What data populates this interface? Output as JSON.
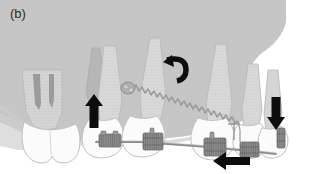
{
  "figure": {
    "panel_label": "(b)",
    "type": "dental-orthodontic-illustration",
    "caption_text": "",
    "colors": {
      "background": "#ffffff",
      "gingiva_bone": "#c6c6c6",
      "bone_shadow": "#b9b9b9",
      "tooth_crown": "#fbfbfb",
      "tooth_root": "#d6d6d6",
      "tooth_outline": "#b0b0b0",
      "impacted_tooth": "#bdbdbd",
      "bracket": "#8d8d8d",
      "bracket_dark": "#7a7a7a",
      "archwire": "#8a8a8a",
      "coil_spring": "#9a9a9a",
      "arrow": "#111111",
      "label_text": "#2b2b2b"
    },
    "elements": {
      "arrow_up_label": "extrusion-force-arrow-up",
      "arrow_down_label": "intrusion-force-arrow-down",
      "arrow_left_label": "retraction-force-arrow-left",
      "arrow_curved_label": "rotation-moment-arrow",
      "coil_spring_label": "nickel-titanium-coil-spring",
      "button_label": "bonded-traction-button",
      "archwire_label": "archwire",
      "brackets_count": 5
    }
  }
}
